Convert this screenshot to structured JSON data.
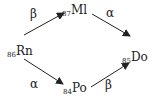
{
  "diagram": {
    "type": "decay-scheme",
    "nodes": {
      "rn": {
        "z": "86",
        "symbol": "Rn"
      },
      "ml": {
        "z": "87",
        "symbol": "Ml"
      },
      "do": {
        "z": "85",
        "symbol": "Do"
      },
      "po": {
        "z": "84",
        "symbol": "Po"
      }
    },
    "edges": [
      {
        "from": "Rn",
        "to": "Ml",
        "label": "β"
      },
      {
        "from": "Ml",
        "to": "Do",
        "label": "α"
      },
      {
        "from": "Rn",
        "to": "Po",
        "label": "α"
      },
      {
        "from": "Po",
        "to": "Do",
        "label": "β"
      }
    ],
    "arrow_color": "#222222"
  }
}
